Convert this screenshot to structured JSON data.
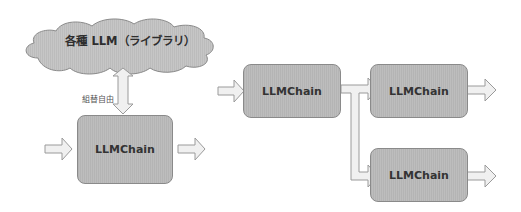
{
  "diagram": {
    "left": {
      "cloud_label": "各種 LLM（ライブラリ）",
      "swap_label": "組替自由",
      "chain_label": "LLMChain"
    },
    "right": {
      "chains": [
        {
          "label": "LLMChain"
        },
        {
          "label": "LLMChain"
        },
        {
          "label": "LLMChain"
        }
      ]
    }
  },
  "colors": {
    "box_fill": "#b8b8b8",
    "box_border": "#8a8a8a",
    "arrow_fill": "#f0f0f0",
    "arrow_stroke": "#9a9a9a",
    "cloud_fill": "#c4c4c4",
    "text": "#333333"
  }
}
